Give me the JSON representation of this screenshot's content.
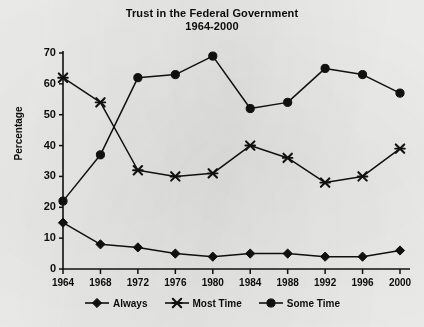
{
  "chart_data": {
    "type": "line",
    "title": "Trust in the Federal Government",
    "subtitle": "1964-2000",
    "xlabel": "",
    "ylabel": "Percentage",
    "categories": [
      "1964",
      "1968",
      "1972",
      "1976",
      "1980",
      "1984",
      "1988",
      "1992",
      "1996",
      "2000"
    ],
    "x": [
      1964,
      1968,
      1972,
      1976,
      1980,
      1984,
      1988,
      1992,
      1996,
      2000
    ],
    "ylim": [
      0,
      70
    ],
    "yticks": [
      "0",
      "10",
      "20",
      "30",
      "40",
      "50",
      "60",
      "70"
    ],
    "ytick_values": [
      0,
      10,
      20,
      30,
      40,
      50,
      60,
      70
    ],
    "grid": false,
    "legend_position": "bottom",
    "series": [
      {
        "name": "Always",
        "marker": "diamond",
        "color": "#111111",
        "values": [
          15,
          8,
          7,
          5,
          4,
          5,
          5,
          4,
          4,
          6
        ]
      },
      {
        "name": "Most Time",
        "marker": "x-star",
        "color": "#111111",
        "values": [
          62,
          54,
          32,
          30,
          31,
          40,
          36,
          28,
          30,
          39
        ]
      },
      {
        "name": "Some Time",
        "marker": "circle",
        "color": "#111111",
        "values": [
          22,
          37,
          62,
          63,
          69,
          52,
          54,
          65,
          63,
          57
        ]
      }
    ]
  },
  "legend": {
    "items": [
      {
        "label": "Always"
      },
      {
        "label": "Most Time"
      },
      {
        "label": "Some Time"
      }
    ]
  }
}
